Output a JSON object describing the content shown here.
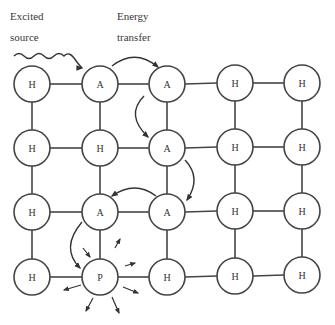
{
  "labels": {
    "excited_source_line1": "Excited",
    "excited_source_line2": "source",
    "energy_transfer_line1": "Energy",
    "energy_transfer_line2": "transfer"
  },
  "grid": {
    "rows": [
      [
        "H",
        "A",
        "A",
        "H",
        "H"
      ],
      [
        "H",
        "H",
        "A",
        "H",
        "H"
      ],
      [
        "H",
        "A",
        "A",
        "H",
        "H"
      ],
      [
        "H",
        "P",
        "H",
        "H",
        "H"
      ]
    ],
    "legend_meaning": {}
  },
  "nodes": {
    "r0c0": "H",
    "r0c1": "A",
    "r0c2": "A",
    "r0c3": "H",
    "r0c4": "H",
    "r1c0": "H",
    "r1c1": "H",
    "r1c2": "A",
    "r1c3": "H",
    "r1c4": "H",
    "r2c0": "H",
    "r2c1": "A",
    "r2c2": "A",
    "r2c3": "H",
    "r2c4": "H",
    "r3c0": "H",
    "r3c1": "P",
    "r3c2": "H",
    "r3c3": "H",
    "r3c4": "H"
  },
  "energy_path": [
    "r0c1",
    "r0c2",
    "r1c2",
    "r2c2",
    "r2c1",
    "r3c1"
  ],
  "colors": {
    "stroke": "#333333",
    "background": "#ffffff"
  }
}
